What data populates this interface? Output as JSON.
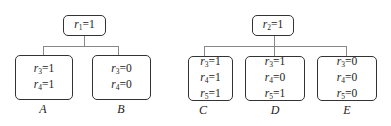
{
  "trees": [
    {
      "root": {
        "var": "r",
        "sub": "1",
        "eq": "=1"
      },
      "children": [
        {
          "label": "A",
          "rows": [
            {
              "var": "r",
              "sub": "3",
              "eq": "=1"
            },
            {
              "var": "r",
              "sub": "4",
              "eq": "=1"
            }
          ]
        },
        {
          "label": "B",
          "rows": [
            {
              "var": "r",
              "sub": "3",
              "eq": "=0"
            },
            {
              "var": "r",
              "sub": "4",
              "eq": "=0"
            }
          ]
        }
      ]
    },
    {
      "root": {
        "var": "r",
        "sub": "2",
        "eq": "=1"
      },
      "children": [
        {
          "label": "C",
          "rows": [
            {
              "var": "r",
              "sub": "3",
              "eq": "=1"
            },
            {
              "var": "r",
              "sub": "4",
              "eq": "=1"
            },
            {
              "var": "r",
              "sub": "5",
              "eq": "=1"
            }
          ]
        },
        {
          "label": "D",
          "rows": [
            {
              "var": "r",
              "sub": "3",
              "eq": "=1"
            },
            {
              "var": "r",
              "sub": "4",
              "eq": "=0"
            },
            {
              "var": "r",
              "sub": "5",
              "eq": "=1"
            }
          ]
        },
        {
          "label": "E",
          "rows": [
            {
              "var": "r",
              "sub": "3",
              "eq": "=0"
            },
            {
              "var": "r",
              "sub": "4",
              "eq": "=0"
            },
            {
              "var": "r",
              "sub": "5",
              "eq": "=0"
            }
          ]
        }
      ]
    }
  ]
}
